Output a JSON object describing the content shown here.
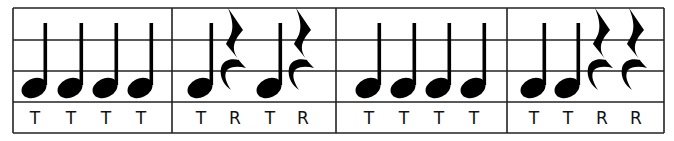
{
  "grid": {
    "left": 13,
    "right": 664,
    "top": 8,
    "bottom": 133,
    "hlines": [
      40,
      71,
      102
    ],
    "measure_dividers": [
      172,
      336,
      507
    ],
    "line_color": "#222222"
  },
  "measures": [
    {
      "symbols": [
        {
          "type": "quarter-note",
          "x": 34,
          "label": "T"
        },
        {
          "type": "quarter-note",
          "x": 70,
          "label": "T"
        },
        {
          "type": "quarter-note",
          "x": 105,
          "label": "T"
        },
        {
          "type": "quarter-note",
          "x": 140,
          "label": "T"
        }
      ]
    },
    {
      "symbols": [
        {
          "type": "quarter-note",
          "x": 200,
          "label": "T"
        },
        {
          "type": "quarter-rest",
          "x": 235,
          "label": "R"
        },
        {
          "type": "quarter-note",
          "x": 269,
          "label": "T"
        },
        {
          "type": "quarter-rest",
          "x": 303,
          "label": "R"
        }
      ]
    },
    {
      "symbols": [
        {
          "type": "quarter-note",
          "x": 368,
          "label": "T"
        },
        {
          "type": "quarter-note",
          "x": 403,
          "label": "T"
        },
        {
          "type": "quarter-note",
          "x": 438,
          "label": "T"
        },
        {
          "type": "quarter-note",
          "x": 473,
          "label": "T"
        }
      ]
    },
    {
      "symbols": [
        {
          "type": "quarter-note",
          "x": 533,
          "label": "T"
        },
        {
          "type": "quarter-note",
          "x": 567,
          "label": "T"
        },
        {
          "type": "quarter-rest",
          "x": 602,
          "label": "R"
        },
        {
          "type": "quarter-rest",
          "x": 636,
          "label": "R"
        }
      ]
    }
  ],
  "legend": {
    "T": "Ta (quarter note)",
    "R": "Rest (quarter rest)"
  }
}
